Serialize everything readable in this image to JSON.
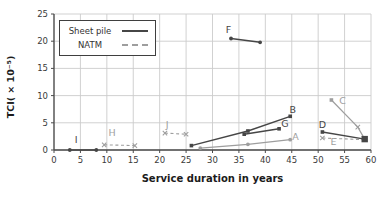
{
  "figure": {
    "xlabel": "Service duration in years",
    "ylabel": "TCI( × 10⁻⁵)",
    "legend": {
      "sheet_pile_label": "Sheet pile",
      "natm_label": "NATM"
    }
  },
  "colors": {
    "dark_series": "#464646",
    "light_series": "#9e9e9e",
    "grid": "#cccccc",
    "axis": "#4a4a4a",
    "tick_text": "#3a3a3a"
  },
  "chart_data": {
    "type": "scatter",
    "title": "",
    "xlabel": "Service duration in years",
    "ylabel": "TCI( × 10⁻⁵)",
    "xlim": [
      0,
      60
    ],
    "ylim": [
      0,
      25
    ],
    "xticks": [
      0,
      5,
      10,
      15,
      20,
      25,
      30,
      35,
      40,
      45,
      50,
      55,
      60
    ],
    "yticks": [
      0,
      5,
      10,
      15,
      20,
      25
    ],
    "grid": true,
    "legend_position": "top-left",
    "legend_entries": [
      {
        "label": "Sheet pile",
        "style": "solid",
        "color": "#464646"
      },
      {
        "label": "NATM",
        "style": "dashed",
        "color": "#9e9e9e"
      }
    ],
    "series": [
      {
        "name": "I",
        "group": "Sheet pile",
        "line": "solid",
        "color": "#464646",
        "marker": "dot",
        "points": [
          [
            3,
            0
          ],
          [
            8,
            0
          ]
        ],
        "label_at": [
          4.2,
          1.9
        ]
      },
      {
        "name": "H",
        "group": "NATM",
        "line": "dashed",
        "color": "#9e9e9e",
        "marker": "x",
        "points": [
          [
            9.5,
            0.95
          ],
          [
            15.3,
            0.8
          ]
        ],
        "label_at": [
          11,
          3.2
        ]
      },
      {
        "name": "J",
        "group": "NATM",
        "line": "dashed",
        "color": "#9e9e9e",
        "marker": "x",
        "points": [
          [
            21,
            3.1
          ],
          [
            25,
            2.9
          ]
        ],
        "label_at": [
          21.4,
          4.7
        ]
      },
      {
        "name": "A",
        "group": "Sheet pile",
        "line": "solid",
        "color": "#9e9e9e",
        "marker": "dot",
        "points": [
          [
            27.7,
            0.35
          ],
          [
            36.7,
            1.05
          ],
          [
            44.7,
            1.9
          ]
        ],
        "label_at": [
          45.7,
          2.4
        ]
      },
      {
        "name": "B",
        "group": "Sheet pile",
        "line": "solid",
        "color": "#464646",
        "marker": "square",
        "points": [
          [
            26,
            0.8
          ],
          [
            36.7,
            3.5
          ],
          [
            44.7,
            6.2
          ]
        ],
        "label_at": [
          45.2,
          7.5
        ]
      },
      {
        "name": "G",
        "group": "Sheet pile",
        "line": "solid",
        "color": "#464646",
        "marker": "square",
        "points": [
          [
            36,
            2.9
          ],
          [
            42.6,
            3.9
          ]
        ],
        "label_at": [
          43.7,
          4.8
        ]
      },
      {
        "name": "F",
        "group": "Sheet pile",
        "line": "solid",
        "color": "#464646",
        "marker": "dot",
        "points": [
          [
            33.5,
            20.5
          ],
          [
            39,
            19.8
          ]
        ],
        "label_at": [
          33,
          22.1
        ]
      },
      {
        "name": "C",
        "group": "Sheet pile",
        "line": "solid",
        "color": "#9e9e9e",
        "marker": "x",
        "markers": [
          "square",
          "x",
          "none"
        ],
        "points": [
          [
            52.5,
            9.2
          ],
          [
            57.5,
            4.2
          ],
          [
            58.8,
            2.0
          ]
        ],
        "label_at": [
          54.6,
          9.1
        ]
      },
      {
        "name": "E",
        "group": "NATM",
        "line": "dashed",
        "color": "#9e9e9e",
        "marker": "x",
        "markers": [
          "x",
          "none"
        ],
        "points": [
          [
            50.8,
            2.2
          ],
          [
            58.8,
            1.9
          ]
        ],
        "label_at": [
          52.9,
          1.6
        ]
      },
      {
        "name": "D",
        "group": "Sheet pile",
        "line": "solid",
        "color": "#464646",
        "marker": "square",
        "big_end": true,
        "points": [
          [
            50.8,
            3.3
          ],
          [
            58.8,
            2.0
          ]
        ],
        "label_at": [
          50.8,
          4.7
        ]
      }
    ]
  }
}
